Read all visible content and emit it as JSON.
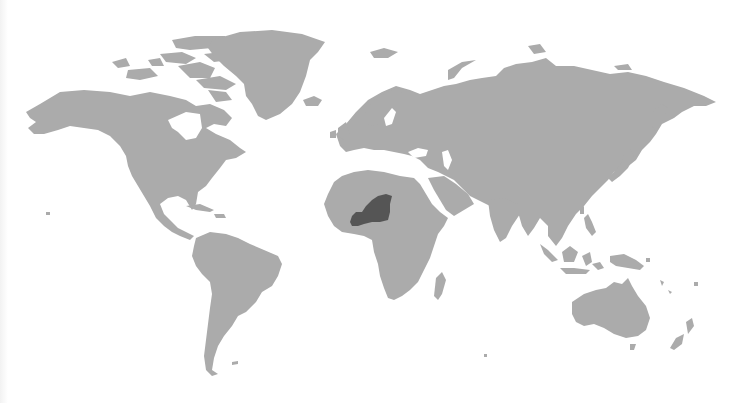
{
  "map": {
    "type": "world-choropleth",
    "projection": "miller-like",
    "background_color": "#ffffff",
    "land_color": "#ababab",
    "highlight_color": "#555555",
    "highlighted_country": "Niger",
    "highlighted_region": "West Africa",
    "caption": "World map with Niger highlighted"
  }
}
